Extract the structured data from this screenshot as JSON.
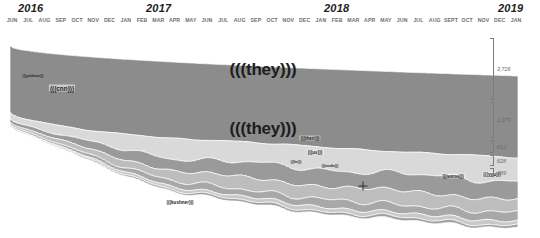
{
  "axis": {
    "years": [
      {
        "label": "2016",
        "x": 24
      },
      {
        "label": "2017",
        "x": 152
      },
      {
        "label": "2018",
        "x": 330
      },
      {
        "label": "2019",
        "x": 508
      }
    ],
    "months": [
      "JUN",
      "JUL",
      "AUG",
      "SEP",
      "OCT",
      "NOV",
      "DEC",
      "JAN",
      "FEB",
      "MAR",
      "APR",
      "MAY",
      "JUN",
      "JUL",
      "AUG",
      "SEP",
      "OCT",
      "NOV",
      "DEC",
      "JAN",
      "FEB",
      "MAR",
      "APR",
      "MAY",
      "JUN",
      "JUL",
      "AUG",
      "SEPT",
      "OCT",
      "NOV",
      "DEC",
      "JAN"
    ]
  },
  "scale": {
    "ticks": [
      {
        "label": "3,726",
        "top": 10,
        "height": 62
      },
      {
        "label": "1,073",
        "top": 74,
        "height": 36
      },
      {
        "label": "812",
        "top": 112,
        "height": 13
      },
      {
        "label": "628",
        "top": 127,
        "height": 11
      },
      {
        "label": "389",
        "top": 140,
        "height": 9
      }
    ]
  },
  "labels": [
    {
      "text": "(((they)))",
      "x": 263,
      "y": 42,
      "size": "big"
    },
    {
      "text": "(((they)))",
      "x": 263,
      "y": 101,
      "size": "big"
    },
    {
      "text": "(((cnn)))",
      "x": 62,
      "y": 60,
      "size": "mid"
    },
    {
      "text": "(((their)))",
      "x": 310,
      "y": 110,
      "size": "small"
    },
    {
      "text": "(((us)))",
      "x": 315,
      "y": 124,
      "size": "small"
    },
    {
      "text": "(((soros)))",
      "x": 453,
      "y": 148,
      "size": "small"
    },
    {
      "text": "(((you)))",
      "x": 492,
      "y": 146,
      "size": "small"
    },
    {
      "text": "(((kushner)))",
      "x": 180,
      "y": 174,
      "size": "small"
    },
    {
      "text": "(((he)))",
      "x": 296,
      "y": 134,
      "size": "tiny"
    },
    {
      "text": "(((media)))",
      "x": 330,
      "y": 138,
      "size": "tiny"
    },
    {
      "text": "(((goldman)))",
      "x": 33,
      "y": 48,
      "size": "tiny"
    }
  ],
  "marker": {
    "name": "crosshair-marker",
    "x": 363,
    "y": 186
  },
  "chart_data": {
    "type": "area",
    "title": "",
    "xlabel": "",
    "ylabel": "",
    "stacking": "streamgraph-bottom-aligned",
    "x": [
      "2016-06",
      "2016-07",
      "2016-08",
      "2016-09",
      "2016-10",
      "2016-11",
      "2016-12",
      "2017-01",
      "2017-02",
      "2017-03",
      "2017-04",
      "2017-05",
      "2017-06",
      "2017-07",
      "2017-08",
      "2017-09",
      "2017-10",
      "2017-11",
      "2017-12",
      "2018-01",
      "2018-02",
      "2018-03",
      "2018-04",
      "2018-05",
      "2018-06",
      "2018-07",
      "2018-08",
      "2018-09",
      "2018-10",
      "2018-11",
      "2018-12",
      "2019-01"
    ],
    "axis_ranges": {
      "x": [
        "2016-06",
        "2019-01"
      ],
      "y": [
        0,
        3726
      ]
    },
    "grid": false,
    "legend": "inline-labels",
    "series": [
      {
        "name": "(((they)))",
        "color": "#8c8c8c",
        "final_value": 3726,
        "values": [
          3050,
          3120,
          3180,
          3250,
          3300,
          3360,
          3420,
          3430,
          3450,
          3480,
          3500,
          3490,
          3470,
          3460,
          3480,
          3500,
          3520,
          3540,
          3560,
          3580,
          3590,
          3600,
          3620,
          3630,
          3650,
          3660,
          3680,
          3690,
          3700,
          3710,
          3720,
          3726
        ]
      },
      {
        "name": "(((they)))-2",
        "color": "#d9d9d9",
        "final_value": 1073,
        "values": [
          260,
          300,
          360,
          420,
          480,
          540,
          620,
          700,
          760,
          820,
          870,
          900,
          930,
          950,
          960,
          965,
          970,
          975,
          980,
          990,
          1000,
          1005,
          1010,
          1020,
          1030,
          1035,
          1040,
          1050,
          1058,
          1064,
          1070,
          1073
        ]
      },
      {
        "name": "(((their)))",
        "color": "#9a9a9a",
        "final_value": 812,
        "values": [
          150,
          170,
          200,
          240,
          290,
          340,
          400,
          450,
          500,
          540,
          580,
          610,
          640,
          660,
          680,
          700,
          715,
          730,
          742,
          755,
          765,
          772,
          780,
          788,
          794,
          798,
          802,
          806,
          808,
          810,
          811,
          812
        ]
      },
      {
        "name": "(((us)))",
        "color": "#bdbdbd",
        "final_value": 628,
        "values": [
          100,
          115,
          140,
          175,
          215,
          260,
          305,
          350,
          390,
          425,
          455,
          480,
          505,
          525,
          545,
          562,
          578,
          590,
          600,
          608,
          612,
          616,
          619,
          621,
          623,
          624,
          625,
          626,
          627,
          627,
          628,
          628
        ]
      },
      {
        "name": "(((soros)))",
        "color": "#a8a8a8",
        "final_value": 389,
        "values": [
          60,
          70,
          85,
          105,
          130,
          155,
          180,
          205,
          228,
          248,
          266,
          282,
          296,
          308,
          320,
          330,
          340,
          348,
          356,
          362,
          368,
          372,
          376,
          379,
          382,
          384,
          386,
          387,
          388,
          388,
          389,
          389
        ]
      },
      {
        "name": "(((kushner)))",
        "color": "#c9c9c9",
        "final_value": 200,
        "values": [
          30,
          36,
          44,
          54,
          66,
          80,
          94,
          108,
          120,
          132,
          142,
          150,
          158,
          164,
          170,
          175,
          180,
          184,
          188,
          190,
          192,
          194,
          195,
          196,
          197,
          198,
          198,
          199,
          199,
          200,
          200,
          200
        ]
      },
      {
        "name": "(((cnn)))",
        "color": "#9f9f9f",
        "final_value": 120,
        "values": [
          20,
          24,
          29,
          36,
          44,
          52,
          60,
          68,
          75,
          81,
          87,
          92,
          96,
          100,
          103,
          106,
          109,
          111,
          113,
          115,
          116,
          117,
          118,
          118,
          119,
          119,
          119,
          120,
          120,
          120,
          120,
          120
        ]
      }
    ]
  }
}
